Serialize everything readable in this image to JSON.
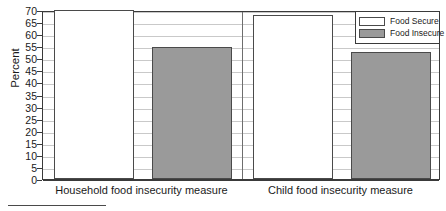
{
  "chart_data": {
    "type": "bar",
    "title": "",
    "subtitle": "",
    "xlabel": "",
    "ylabel": "Percent",
    "ylim": [
      0,
      70
    ],
    "ytick_step": 5,
    "yticks": [
      70,
      65,
      60,
      55,
      50,
      45,
      40,
      35,
      30,
      25,
      20,
      15,
      10,
      5,
      0
    ],
    "grid": true,
    "grid_axis": "y",
    "legend_position": "top-right",
    "categories": [
      "Household food insecurity measure",
      "Child food insecurity measure"
    ],
    "series": [
      {
        "name": "Food Secure",
        "color": "#ffffff",
        "edge_color": "#4a4a4a",
        "values": [
          69.8,
          68.0
        ]
      },
      {
        "name": "Food Insecure",
        "color": "#9a9a9a",
        "edge_color": "#4a4a4a",
        "values": [
          54.7,
          52.7
        ]
      }
    ],
    "annotations": []
  },
  "legend": {
    "items": [
      {
        "label": "Food Secure",
        "swatch": "white-swatch"
      },
      {
        "label": "Food Insecure",
        "swatch": "gray-swatch"
      }
    ]
  },
  "axes": {
    "y_title": "Percent",
    "y_tick_labels": [
      "70",
      "65",
      "60",
      "55",
      "50",
      "45",
      "40",
      "35",
      "30",
      "25",
      "20",
      "15",
      "10",
      "5",
      "0"
    ],
    "x_tick_labels": [
      "Household food insecurity measure",
      "Child food insecurity measure"
    ]
  },
  "colors": {
    "bar_secure": "#ffffff",
    "bar_insecure": "#9a9a9a",
    "bar_edge": "#4a4a4a",
    "frame": "#3a3a3a",
    "gridline": "#c9c9c9",
    "text": "#1a1a1a"
  },
  "footnote": {
    "rule_visible": true,
    "text": ""
  }
}
